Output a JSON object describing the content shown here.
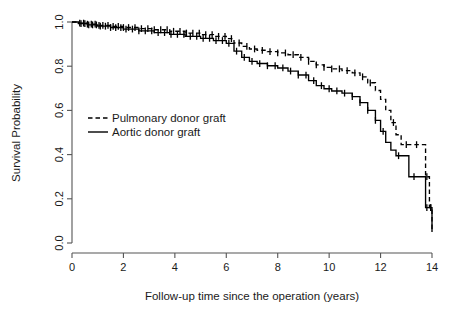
{
  "chart_data": {
    "type": "line",
    "subtype": "kaplan-meier-survival",
    "title": "",
    "xlabel": "Follow-up time since the operation (years)",
    "ylabel": "Survival Probability",
    "xlim": [
      0,
      14
    ],
    "ylim": [
      0,
      1
    ],
    "xticks": [
      0,
      2,
      4,
      6,
      8,
      10,
      12,
      14
    ],
    "xticklabels": [
      "0",
      "2",
      "4",
      "6",
      "8",
      "10",
      "12",
      "14"
    ],
    "yticks": [
      0.0,
      0.2,
      0.4,
      0.6,
      0.8,
      1.0
    ],
    "yticklabels": [
      "0.0",
      "0.2",
      "0.4",
      "0.6",
      "0.8",
      "1.0"
    ],
    "grid": false,
    "legend_position": "center-left",
    "series": [
      {
        "name": "Pulmonary donor graft",
        "style": "dashed",
        "color": "#000000",
        "points": [
          [
            0.0,
            1.0
          ],
          [
            0.25,
            0.995
          ],
          [
            0.6,
            0.99
          ],
          [
            1.0,
            0.985
          ],
          [
            1.5,
            0.98
          ],
          [
            2.0,
            0.975
          ],
          [
            2.6,
            0.97
          ],
          [
            3.2,
            0.965
          ],
          [
            3.8,
            0.958
          ],
          [
            4.4,
            0.95
          ],
          [
            5.0,
            0.943
          ],
          [
            5.5,
            0.935
          ],
          [
            6.0,
            0.925
          ],
          [
            6.3,
            0.905
          ],
          [
            6.6,
            0.89
          ],
          [
            6.9,
            0.878
          ],
          [
            7.2,
            0.872
          ],
          [
            7.6,
            0.866
          ],
          [
            8.0,
            0.86
          ],
          [
            8.4,
            0.852
          ],
          [
            8.8,
            0.84
          ],
          [
            9.2,
            0.822
          ],
          [
            9.5,
            0.806
          ],
          [
            9.8,
            0.795
          ],
          [
            10.1,
            0.788
          ],
          [
            10.5,
            0.78
          ],
          [
            10.9,
            0.77
          ],
          [
            11.2,
            0.752
          ],
          [
            11.5,
            0.725
          ],
          [
            11.8,
            0.69
          ],
          [
            12.0,
            0.65
          ],
          [
            12.2,
            0.6
          ],
          [
            12.4,
            0.545
          ],
          [
            12.6,
            0.49
          ],
          [
            12.8,
            0.445
          ],
          [
            13.2,
            0.445
          ],
          [
            13.6,
            0.445
          ],
          [
            13.75,
            0.3
          ],
          [
            13.9,
            0.16
          ],
          [
            14.0,
            0.05
          ]
        ],
        "censor_times": [
          0.3,
          0.45,
          0.6,
          0.75,
          0.9,
          1.05,
          1.2,
          1.4,
          1.6,
          1.8,
          2.0,
          2.2,
          2.45,
          2.7,
          2.95,
          3.2,
          3.45,
          3.7,
          3.95,
          4.2,
          4.45,
          4.7,
          4.95,
          5.2,
          5.45,
          5.7,
          5.95,
          6.2,
          6.5,
          6.8,
          7.1,
          7.4,
          7.7,
          8.0,
          8.3,
          8.6,
          8.9,
          9.2,
          9.5,
          9.8,
          10.1,
          10.4,
          10.7,
          11.0,
          11.3,
          11.6,
          12.5,
          13.0,
          13.4,
          13.8,
          13.95
        ]
      },
      {
        "name": "Aortic donor graft",
        "style": "solid",
        "color": "#000000",
        "points": [
          [
            0.0,
            1.0
          ],
          [
            0.25,
            0.993
          ],
          [
            0.6,
            0.987
          ],
          [
            1.0,
            0.981
          ],
          [
            1.5,
            0.975
          ],
          [
            2.0,
            0.968
          ],
          [
            2.6,
            0.96
          ],
          [
            3.2,
            0.952
          ],
          [
            3.8,
            0.944
          ],
          [
            4.4,
            0.935
          ],
          [
            5.0,
            0.926
          ],
          [
            5.5,
            0.916
          ],
          [
            6.0,
            0.903
          ],
          [
            6.3,
            0.868
          ],
          [
            6.6,
            0.84
          ],
          [
            6.9,
            0.822
          ],
          [
            7.2,
            0.812
          ],
          [
            7.6,
            0.802
          ],
          [
            8.0,
            0.792
          ],
          [
            8.4,
            0.778
          ],
          [
            8.8,
            0.76
          ],
          [
            9.2,
            0.735
          ],
          [
            9.5,
            0.712
          ],
          [
            9.8,
            0.698
          ],
          [
            10.1,
            0.688
          ],
          [
            10.5,
            0.678
          ],
          [
            10.9,
            0.662
          ],
          [
            11.2,
            0.635
          ],
          [
            11.5,
            0.6
          ],
          [
            11.8,
            0.555
          ],
          [
            12.0,
            0.505
          ],
          [
            12.2,
            0.455
          ],
          [
            12.4,
            0.42
          ],
          [
            12.6,
            0.395
          ],
          [
            12.9,
            0.395
          ],
          [
            13.1,
            0.3
          ],
          [
            13.6,
            0.3
          ],
          [
            13.75,
            0.16
          ],
          [
            13.9,
            0.16
          ],
          [
            14.0,
            0.05
          ]
        ],
        "censor_times": [
          0.35,
          0.5,
          0.65,
          0.8,
          0.95,
          1.1,
          1.3,
          1.5,
          1.7,
          1.9,
          2.1,
          2.35,
          2.6,
          2.85,
          3.1,
          3.35,
          3.6,
          3.85,
          4.1,
          4.35,
          4.6,
          4.85,
          5.1,
          5.35,
          5.6,
          5.85,
          6.1,
          6.4,
          6.7,
          7.0,
          7.3,
          7.6,
          7.9,
          8.2,
          8.5,
          8.8,
          9.1,
          9.4,
          9.7,
          10.0,
          10.3,
          10.6,
          10.9,
          11.2,
          11.5,
          11.8,
          12.1,
          12.7,
          13.3,
          13.8,
          13.95
        ]
      }
    ]
  },
  "legend": {
    "entries": [
      {
        "label": "Pulmonary donor graft",
        "style": "dashed"
      },
      {
        "label": "Aortic donor graft",
        "style": "solid"
      }
    ]
  }
}
